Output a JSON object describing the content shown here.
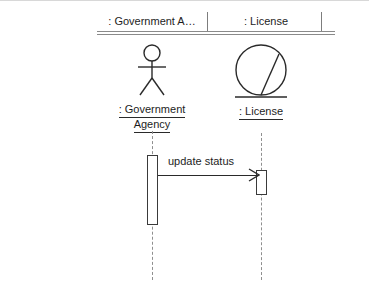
{
  "diagram": {
    "type": "uml-sequence-diagram",
    "background_color": "#ffffff",
    "line_color": "#2a2a2a",
    "header": {
      "columns": [
        {
          "label": ": Government A…"
        },
        {
          "label": ": License"
        }
      ]
    },
    "participants": [
      {
        "id": "government-agency",
        "icon": "actor-stick-figure",
        "label_lines": [
          ": Government",
          "Agency"
        ]
      },
      {
        "id": "license",
        "icon": "entity-circle",
        "label_lines": [
          ": License"
        ]
      }
    ],
    "messages": [
      {
        "label": "update status",
        "from": "government-agency",
        "to": "license",
        "arrow": "open-arrow-right"
      }
    ]
  }
}
